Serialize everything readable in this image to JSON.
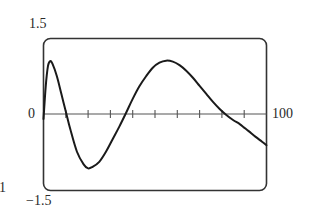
{
  "chart_data": {
    "type": "line",
    "title": "",
    "xlabel": "",
    "ylabel": "",
    "xlim": [
      0,
      100
    ],
    "ylim": [
      -1.5,
      1.5
    ],
    "grid": false,
    "legend": null,
    "x_ticks": [
      0,
      10,
      20,
      30,
      40,
      50,
      60,
      70,
      80,
      90,
      100
    ],
    "tick_labels": {
      "y_top": "1.5",
      "y_bottom": "−1.5",
      "x_left": "0",
      "x_right": "100"
    },
    "series": [
      {
        "name": "curve",
        "x": [
          0,
          1,
          2,
          3,
          4,
          6,
          8,
          10,
          12,
          15,
          18,
          20,
          22,
          25,
          28,
          31,
          34,
          37,
          40,
          43,
          46,
          49,
          52,
          55,
          58,
          61,
          64,
          67,
          70,
          73,
          76,
          79,
          82,
          85,
          88,
          90,
          92,
          95,
          98,
          100
        ],
        "y": [
          -0.1,
          0.55,
          0.95,
          1.05,
          1.0,
          0.75,
          0.4,
          0.05,
          -0.3,
          -0.75,
          -1.0,
          -1.08,
          -1.05,
          -0.95,
          -0.75,
          -0.5,
          -0.25,
          0.02,
          0.3,
          0.55,
          0.75,
          0.92,
          1.02,
          1.06,
          1.04,
          0.97,
          0.86,
          0.72,
          0.56,
          0.4,
          0.24,
          0.1,
          -0.02,
          -0.12,
          -0.2,
          -0.27,
          -0.34,
          -0.45,
          -0.55,
          -0.62
        ]
      }
    ],
    "annotations": [
      "1"
    ]
  },
  "labels": {
    "y_top": "1.5",
    "y_bottom": "−1.5",
    "x_zero": "0",
    "x_max": "100",
    "stray_left": "1"
  }
}
